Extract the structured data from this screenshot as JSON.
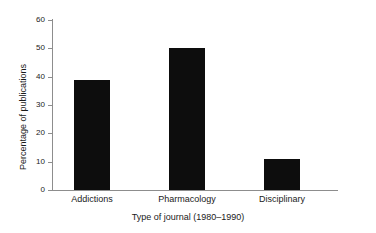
{
  "chart_data": {
    "type": "bar",
    "title": "",
    "xlabel": "Type of journal (1980–1990)",
    "ylabel": "Percentage of publications",
    "categories": [
      "Addictions",
      "Pharmacology",
      "Disciplinary"
    ],
    "values": [
      39,
      50,
      11
    ],
    "ylim": [
      0,
      60
    ],
    "yticks": [
      0,
      10,
      20,
      30,
      40,
      50,
      60
    ],
    "ytick_labels": [
      "0",
      "10",
      "20",
      "30",
      "40",
      "50",
      "60"
    ],
    "grid": false,
    "legend": null,
    "series": [
      {
        "name": "Percentage of publications",
        "values": [
          39,
          50,
          11
        ]
      }
    ],
    "bar_color": "#0d0d0d",
    "axis_color": "#8d8d8d",
    "background_color": "#ffffff"
  }
}
